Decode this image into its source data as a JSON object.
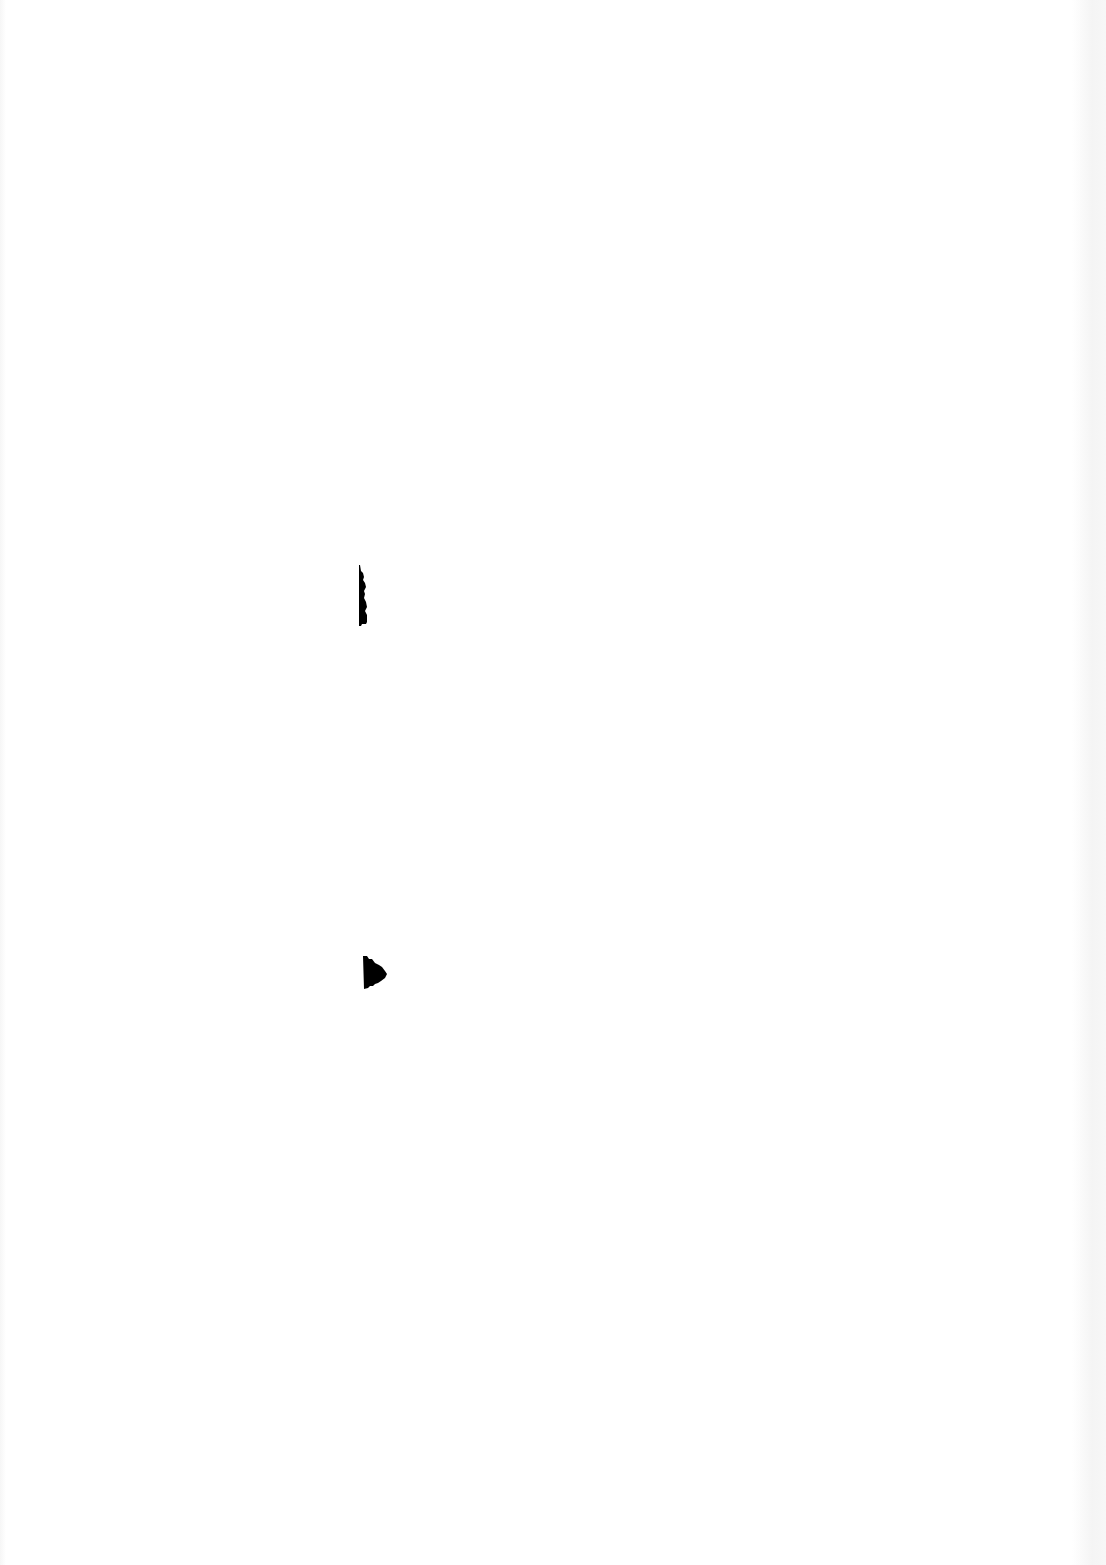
{
  "document": {
    "type": "blank scanned page",
    "text_content": "",
    "width": 1106,
    "height": 1565,
    "background_color": "#ffffff",
    "ink_color": "#000000",
    "marks": [
      {
        "name": "ink-blot-vertical",
        "x": 358,
        "y": 565,
        "width": 12,
        "height": 62
      },
      {
        "name": "ink-blot-arrow",
        "x": 363,
        "y": 955,
        "width": 26,
        "height": 35
      }
    ]
  }
}
